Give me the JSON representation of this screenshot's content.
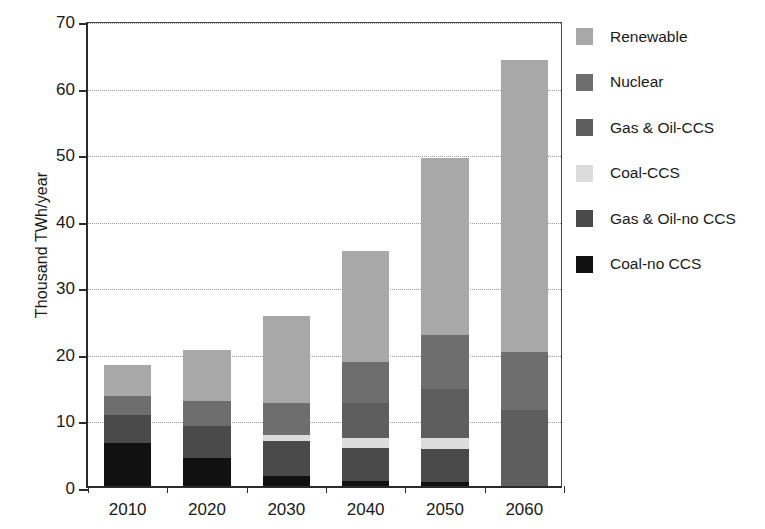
{
  "chart_data": {
    "type": "bar",
    "subtype": "stacked-bar",
    "title": "",
    "subtitle": "",
    "xlabel": "",
    "ylabel": "Thousand TWh/year",
    "categories": [
      "2010",
      "2020",
      "2030",
      "2040",
      "2050",
      "2060"
    ],
    "ylim": [
      0,
      70
    ],
    "yticks": [
      0,
      10,
      20,
      30,
      40,
      50,
      60,
      70
    ],
    "ytick_labels": [
      "0",
      "10",
      "20",
      "30",
      "40",
      "50",
      "60",
      "70"
    ],
    "grid": "horizontal-dotted",
    "legend_position": "right",
    "stack_order_bottom_to_top": [
      "Coal-no CCS",
      "Gas & Oil-no CCS",
      "Coal-CCS",
      "Gas & Oil-CCS",
      "Nuclear",
      "Renewable"
    ],
    "series": [
      {
        "name": "Coal-no CCS",
        "color": "#111111",
        "values": [
          6.5,
          4.2,
          1.5,
          0.8,
          0.6,
          0.0
        ]
      },
      {
        "name": "Gas & Oil-no CCS",
        "color": "#4a4a4a",
        "values": [
          4.2,
          4.8,
          5.2,
          4.9,
          4.9,
          0.0
        ]
      },
      {
        "name": "Coal-CCS",
        "color": "#dcdcdc",
        "values": [
          0.0,
          0.0,
          1.0,
          1.5,
          1.7,
          0.0
        ]
      },
      {
        "name": "Gas & Oil-CCS",
        "color": "#5e5e5e",
        "values": [
          0.0,
          0.0,
          0.0,
          5.3,
          7.3,
          11.4
        ]
      },
      {
        "name": "Nuclear",
        "color": "#6e6e6e",
        "values": [
          2.8,
          3.8,
          4.8,
          6.2,
          8.2,
          8.7
        ]
      },
      {
        "name": "Renewable",
        "color": "#a8a8a8",
        "values": [
          4.7,
          7.6,
          13.0,
          16.6,
          26.6,
          43.9
        ]
      }
    ],
    "totals": [
      18.2,
      20.4,
      25.5,
      35.3,
      49.3,
      64.0
    ],
    "legend": [
      {
        "label": "Renewable",
        "color": "#a8a8a8"
      },
      {
        "label": "Nuclear",
        "color": "#6e6e6e"
      },
      {
        "label": "Gas & Oil-CCS",
        "color": "#5e5e5e"
      },
      {
        "label": "Coal-CCS",
        "color": "#dcdcdc"
      },
      {
        "label": "Gas & Oil-no CCS",
        "color": "#4a4a4a"
      },
      {
        "label": "Coal-no CCS",
        "color": "#111111"
      }
    ],
    "axis_color": "#2b2b2b",
    "grid_color": "#9a9a9a",
    "background": "#ffffff"
  }
}
